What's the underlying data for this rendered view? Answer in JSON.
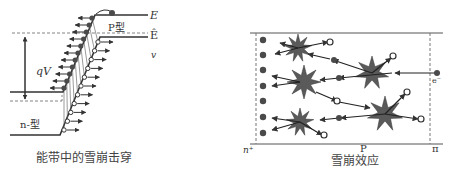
{
  "left_panel": {
    "caption": "能带中的雪崩击穿",
    "labels": {
      "conduction_band": "E",
      "fermi_level": "Ê",
      "valence_band": "v",
      "p_region": "P型",
      "n_region": "n-型",
      "voltage": "qV"
    }
  },
  "right_panel": {
    "caption": "雪崩效应",
    "labels": {
      "left_region": "n⁺",
      "middle_region": "P",
      "right_region": "π",
      "incident_electron": "e⁻"
    }
  },
  "colors": {
    "electron": "#4a4a4a",
    "star": "#5a5a5a",
    "line": "#333333",
    "dashed": "#777777"
  }
}
